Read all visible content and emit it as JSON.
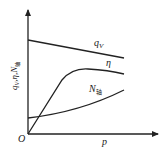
{
  "diagram": {
    "y_axis_label": "q",
    "y_axis_label_sub": "V",
    "y_axis_label_rest": ",η,N",
    "y_axis_label_rest_sub": "轴",
    "x_axis_label": "p",
    "origin_label": "O",
    "curves": [
      {
        "name": "qV",
        "label": "q",
        "label_sub": "V"
      },
      {
        "name": "eta",
        "label": "η"
      },
      {
        "name": "N",
        "label": "N",
        "label_sub": "轴"
      }
    ]
  }
}
